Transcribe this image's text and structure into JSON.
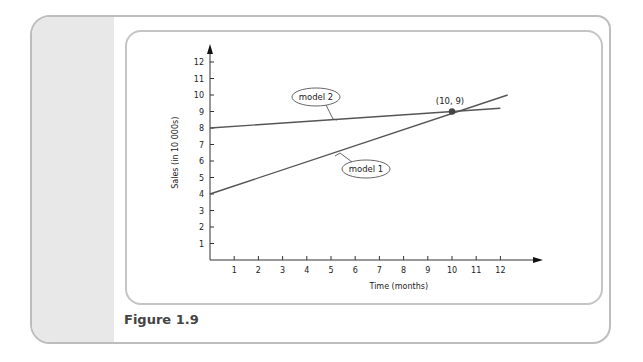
{
  "figure": {
    "caption": "Figure 1.9"
  },
  "chart_data": {
    "type": "line",
    "title": "",
    "xlabel": "Time (months)",
    "ylabel": "Sales (in 10 000s)",
    "x_ticks": [
      1,
      2,
      3,
      4,
      5,
      6,
      7,
      8,
      9,
      10,
      11,
      12
    ],
    "y_ticks": [
      1,
      2,
      3,
      4,
      5,
      6,
      7,
      8,
      9,
      10,
      11,
      12
    ],
    "xlim": [
      0,
      13.5
    ],
    "ylim": [
      0,
      13
    ],
    "grid": false,
    "series": [
      {
        "name": "model 1",
        "x": [
          0,
          12.3
        ],
        "y": [
          4,
          10
        ],
        "equation": "y = 4 + 0.5x"
      },
      {
        "name": "model 2",
        "x": [
          0,
          12
        ],
        "y": [
          8,
          9.2
        ],
        "equation": "y = 8 + 0.1x"
      }
    ],
    "annotations": [
      {
        "type": "point",
        "x": 10,
        "y": 9,
        "label": "(10, 9)"
      },
      {
        "type": "callout",
        "text": "model 2",
        "target_series": "model 2"
      },
      {
        "type": "callout",
        "text": "model 1",
        "target_series": "model 1"
      }
    ],
    "colors": {
      "line": "#555555",
      "axis": "#333333",
      "point": "#444444"
    }
  }
}
